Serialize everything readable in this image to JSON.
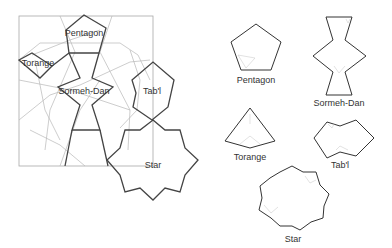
{
  "figure": {
    "composite_labels": {
      "pentagon": "Pentagon",
      "torange": "Torange",
      "sormeh_dan": "Sormeh-Dan",
      "tabl": "Tab'l",
      "star": "Star"
    },
    "tile_labels": {
      "pentagon": "Pentagon",
      "sormeh_dan": "Sormeh-Dan",
      "torange": "Torange",
      "tabl": "Tab'l",
      "star": "Star"
    },
    "colors": {
      "outline": "#333333",
      "guide_lines": "#b8b8b8",
      "background": "#ffffff"
    }
  }
}
